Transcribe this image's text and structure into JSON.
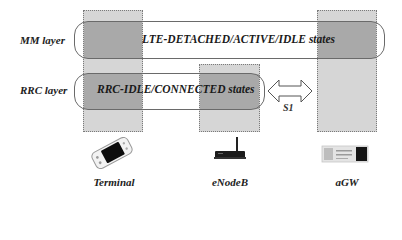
{
  "diagram": {
    "layers": [
      {
        "id": "mm",
        "label": "MM layer",
        "states_text": "LTE-DETACHED/ACTIVE/IDLE states"
      },
      {
        "id": "rrc",
        "label": "RRC layer",
        "states_text": "RRC-IDLE/CONNECTED  states"
      }
    ],
    "interface": {
      "label": "S1",
      "icon": "double-arrow-icon"
    },
    "nodes": [
      {
        "id": "terminal",
        "label": "Terminal",
        "icon": "handheld-terminal-icon"
      },
      {
        "id": "enodeb",
        "label": "eNodeB",
        "icon": "wireless-router-icon"
      },
      {
        "id": "agw",
        "label": "aGW",
        "icon": "gateway-server-icon"
      }
    ],
    "colors": {
      "column_fill": "#d6d6d6",
      "overlap_fill": "#a9a9a9",
      "band_border": "#6a6a6a",
      "background": "#ffffff"
    }
  }
}
